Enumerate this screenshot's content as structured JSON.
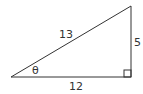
{
  "diagram": {
    "type": "right-triangle",
    "stroke_color": "#333333",
    "labels": {
      "hypotenuse": "13",
      "opposite": "5",
      "adjacent": "12",
      "angle": "θ"
    },
    "right_angle_marker": true
  }
}
